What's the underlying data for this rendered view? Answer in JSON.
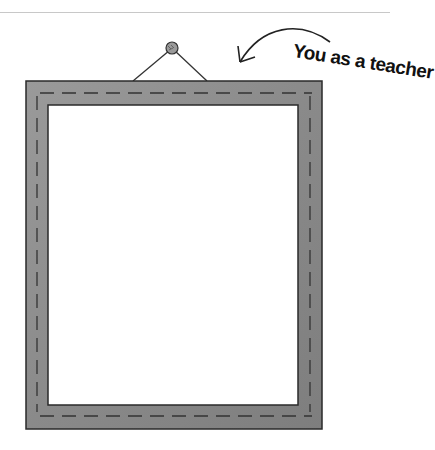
{
  "illustration": {
    "caption": "You as a teacher",
    "elements": [
      "picture-frame",
      "nail",
      "hanging-wire",
      "curved-arrow"
    ],
    "colors": {
      "frame": "#8c8c8c",
      "frame_dark": "#6e6e6e",
      "outline": "#2a2a2a",
      "background": "#ffffff",
      "canvas": "#ffffff"
    }
  }
}
